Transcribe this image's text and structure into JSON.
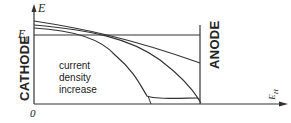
{
  "diagram": {
    "y_axis_label": "E",
    "threshold_label": "E",
    "threshold_subscript": "t",
    "origin_label": "0",
    "x_axis_label": "H",
    "x_axis_label_prefix": "E",
    "cathode_label": "CATHODE",
    "anode_label": "ANODE",
    "annotation": [
      "current",
      "density",
      "increase"
    ],
    "line_color": "#333333"
  }
}
